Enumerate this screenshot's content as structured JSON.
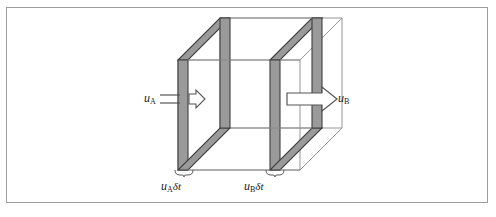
{
  "figure": {
    "type": "diagram",
    "frame": {
      "border_color": "#9d9d9d",
      "background": "#ffffff",
      "x": 6,
      "y": 7,
      "width": 482,
      "height": 196
    },
    "colors": {
      "slab_fill": "#9a9a9a",
      "slab_fill_light": "#b4b4b4",
      "line": "#4a4a4a",
      "thin_line": "#8a8a8a",
      "text": "#1a1a1a",
      "arrow_stroke": "#555555",
      "arrow_fill": "#ffffff"
    },
    "geometry": {
      "projection": "oblique",
      "front_face": {
        "left": 178,
        "top": 60,
        "width": 122,
        "height": 110
      },
      "depth_dx": 42,
      "depth_dy": -42,
      "slab_a_thickness": 10,
      "slab_b_thickness": 10,
      "slab_a_x": 178,
      "slab_b_x": 270
    },
    "labels": {
      "inflow_velocity": {
        "var": "u",
        "sub": "A"
      },
      "outflow_velocity": {
        "var": "u",
        "sub": "B"
      },
      "inflow_thickness": {
        "var": "u",
        "sub": "A",
        "delta": "δt"
      },
      "outflow_thickness": {
        "var": "u",
        "sub": "B",
        "delta": "δt"
      }
    },
    "arrows": {
      "inflow": {
        "name": "inflow-arrow",
        "direction": "right",
        "shaft_x1": 160,
        "shaft_x2": 178,
        "y": 99,
        "head_tip_x": 204,
        "size": "small"
      },
      "outflow": {
        "name": "outflow-arrow",
        "direction": "right",
        "shaft_x1": 288,
        "shaft_x2": 318,
        "y": 99,
        "head_tip_x": 336,
        "size": "large"
      }
    },
    "braces": {
      "inflow": {
        "x1": 176,
        "x2": 192,
        "y": 172
      },
      "outflow": {
        "x1": 266,
        "x2": 282,
        "y": 172
      }
    }
  }
}
